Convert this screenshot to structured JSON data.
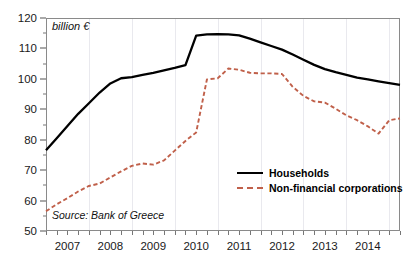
{
  "chart_data": {
    "type": "line",
    "title": "",
    "xlabel": "",
    "ylabel": "billion €",
    "unit_label": "billion €",
    "source": "Source: Bank of Greece",
    "ylim": [
      50,
      120
    ],
    "ytick_step": 10,
    "yticks": [
      50,
      60,
      70,
      80,
      90,
      100,
      110,
      120
    ],
    "ytick_labels": [
      "50",
      "60",
      "70",
      "80",
      "90",
      "100",
      "110",
      "120"
    ],
    "yminor_step": 5,
    "xlim": [
      2006.5,
      2014.75
    ],
    "xticks": [
      2007,
      2008,
      2009,
      2010,
      2011,
      2012,
      2013,
      2014
    ],
    "xtick_labels": [
      "2007",
      "2008",
      "2009",
      "2010",
      "2011",
      "2012",
      "2013",
      "2014"
    ],
    "x_minor_interval": "quarterly",
    "grid": "vertical-only",
    "legend_position": "lower-right",
    "x": [
      2006.5,
      2006.75,
      2007.0,
      2007.25,
      2007.5,
      2007.75,
      2008.0,
      2008.25,
      2008.5,
      2008.75,
      2009.0,
      2009.25,
      2009.5,
      2009.75,
      2010.0,
      2010.25,
      2010.5,
      2010.75,
      2011.0,
      2011.25,
      2011.5,
      2011.75,
      2012.0,
      2012.25,
      2012.5,
      2012.75,
      2013.0,
      2013.25,
      2013.5,
      2013.75,
      2014.0,
      2014.25,
      2014.5,
      2014.75
    ],
    "series": [
      {
        "name": "Households",
        "style": "solid",
        "color": "#000000",
        "values": [
          76.5,
          80.5,
          84.5,
          88.5,
          92.0,
          95.5,
          98.5,
          100.2,
          100.6,
          101.3,
          102.0,
          102.8,
          103.6,
          104.5,
          114.2,
          114.6,
          114.7,
          114.6,
          114.3,
          113.2,
          112.0,
          110.8,
          109.6,
          108.0,
          106.3,
          104.6,
          103.2,
          102.2,
          101.3,
          100.4,
          99.8,
          99.2,
          98.6,
          98.0
        ]
      },
      {
        "name": "Non-financial corporations",
        "style": "dashed",
        "color": "#c0604a",
        "values": [
          56.5,
          58.8,
          60.8,
          63.0,
          64.8,
          65.6,
          67.6,
          69.6,
          71.4,
          72.2,
          71.8,
          73.2,
          76.4,
          79.6,
          82.4,
          99.8,
          100.2,
          103.4,
          103.0,
          102.0,
          101.8,
          101.8,
          101.6,
          97.4,
          94.4,
          92.6,
          92.2,
          90.2,
          88.0,
          86.4,
          84.4,
          82.0,
          86.4,
          87.0
        ]
      }
    ]
  },
  "legend": {
    "items": [
      {
        "label": "Households",
        "style": "solid",
        "color": "#000000"
      },
      {
        "label": "Non-financial corporations",
        "style": "dashed",
        "color": "#c0604a"
      }
    ]
  }
}
